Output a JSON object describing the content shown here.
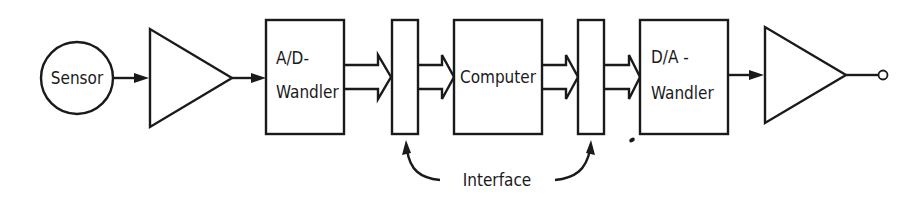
{
  "diagram": {
    "sensor": {
      "label": "Sensor"
    },
    "adc": {
      "line1": "A/D-",
      "line2": "Wandler"
    },
    "computer": {
      "label": "Computer"
    },
    "dac": {
      "line1": "D/A -",
      "line2": "Wandler"
    },
    "interface": {
      "label": "Interface"
    }
  },
  "colors": {
    "stroke": "#1a1a1a",
    "background": "#ffffff"
  }
}
